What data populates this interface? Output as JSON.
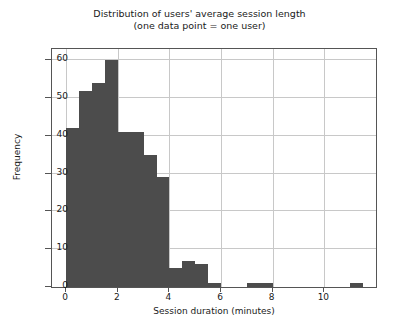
{
  "chart_data": {
    "type": "bar",
    "title": "Distribution of users' average session length",
    "subtitle": "(one data point = one user)",
    "xlabel": "Session duration (minutes)",
    "ylabel": "Frequency",
    "xlim": [
      -0.55,
      12.0
    ],
    "ylim": [
      0,
      63
    ],
    "grid": true,
    "legend": null,
    "bin_width": 0.5,
    "bar_color": "#4c4c4c",
    "grid_color": "#c8c8c8",
    "axis_color": "#555555",
    "text_color": "#1a1a1a",
    "xticks": [
      0,
      2,
      4,
      6,
      8,
      10
    ],
    "xtick_labels": [
      "0",
      "2",
      "4",
      "6",
      "8",
      "10"
    ],
    "yticks": [
      0,
      10,
      20,
      30,
      40,
      50,
      60
    ],
    "ytick_labels": [
      "0",
      "10",
      "20",
      "30",
      "40",
      "50",
      "60"
    ],
    "bins": [
      {
        "x0": 0.0,
        "x1": 0.5,
        "count": 42
      },
      {
        "x0": 0.5,
        "x1": 1.0,
        "count": 52
      },
      {
        "x0": 1.0,
        "x1": 1.5,
        "count": 54
      },
      {
        "x0": 1.5,
        "x1": 2.0,
        "count": 60
      },
      {
        "x0": 2.0,
        "x1": 2.5,
        "count": 41
      },
      {
        "x0": 2.5,
        "x1": 3.0,
        "count": 41
      },
      {
        "x0": 3.0,
        "x1": 3.5,
        "count": 35
      },
      {
        "x0": 3.5,
        "x1": 4.0,
        "count": 29
      },
      {
        "x0": 4.0,
        "x1": 4.5,
        "count": 5
      },
      {
        "x0": 4.5,
        "x1": 5.0,
        "count": 7
      },
      {
        "x0": 5.0,
        "x1": 5.5,
        "count": 6
      },
      {
        "x0": 5.5,
        "x1": 6.0,
        "count": 1
      },
      {
        "x0": 6.0,
        "x1": 6.5,
        "count": 0
      },
      {
        "x0": 6.5,
        "x1": 7.0,
        "count": 0
      },
      {
        "x0": 7.0,
        "x1": 7.5,
        "count": 1
      },
      {
        "x0": 7.5,
        "x1": 8.0,
        "count": 1
      },
      {
        "x0": 8.0,
        "x1": 8.5,
        "count": 0
      },
      {
        "x0": 8.5,
        "x1": 9.0,
        "count": 0
      },
      {
        "x0": 9.0,
        "x1": 9.5,
        "count": 0
      },
      {
        "x0": 9.5,
        "x1": 10.0,
        "count": 0
      },
      {
        "x0": 10.0,
        "x1": 10.5,
        "count": 0
      },
      {
        "x0": 10.5,
        "x1": 11.0,
        "count": 0
      },
      {
        "x0": 11.0,
        "x1": 11.5,
        "count": 1
      }
    ]
  }
}
